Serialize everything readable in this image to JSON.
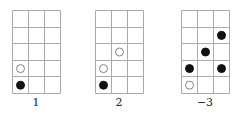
{
  "figure": {
    "grid": {
      "cols": 3,
      "rows": 5,
      "line_color": "#aaaaaa"
    },
    "panels": [
      {
        "label": "1",
        "left": 12,
        "stones": [
          {
            "col": 0,
            "row": 3,
            "color": "white"
          },
          {
            "col": 0,
            "row": 4,
            "color": "black"
          }
        ]
      },
      {
        "label": "2",
        "left": 95,
        "stones": [
          {
            "col": 1,
            "row": 2,
            "color": "white"
          },
          {
            "col": 0,
            "row": 3,
            "color": "white"
          },
          {
            "col": 0,
            "row": 4,
            "color": "black"
          }
        ]
      },
      {
        "label": "−3",
        "left": 181,
        "stones": [
          {
            "col": 2,
            "row": 1,
            "color": "black"
          },
          {
            "col": 1,
            "row": 2,
            "color": "black"
          },
          {
            "col": 0,
            "row": 3,
            "color": "black"
          },
          {
            "col": 2,
            "row": 3,
            "color": "black"
          },
          {
            "col": 0,
            "row": 4,
            "color": "white"
          }
        ]
      }
    ]
  }
}
